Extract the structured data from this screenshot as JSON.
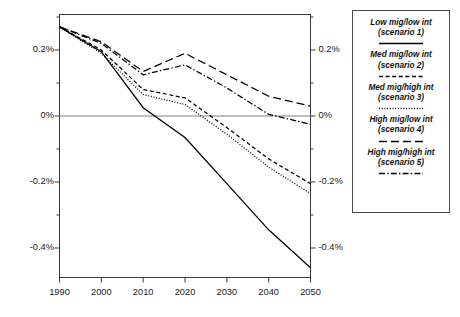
{
  "chart_data": {
    "type": "line",
    "title": "",
    "xlabel": "",
    "ylabel": "",
    "x": [
      1990,
      2000,
      2010,
      2020,
      2030,
      2040,
      2050
    ],
    "xlim": [
      1990,
      2050
    ],
    "ylim": [
      -0.5,
      0.3
    ],
    "xticks": [
      "1990",
      "2000",
      "2010",
      "2020",
      "2030",
      "2040",
      "2050"
    ],
    "yticks": [
      "0.2%",
      "0%",
      "-0.2%",
      "-0.4%"
    ],
    "ytick_values": [
      0.2,
      0.0,
      -0.2,
      -0.4
    ],
    "minor_ticks": true,
    "grid": false,
    "zero_line": true,
    "legend_position": "right",
    "dual_y_axis": true,
    "series": [
      {
        "name": "Low mig/low int (scenario 1)",
        "scenario": "1",
        "style": "solid",
        "values": [
          0.27,
          0.195,
          0.025,
          -0.065,
          -0.205,
          -0.345,
          -0.46
        ]
      },
      {
        "name": "Med mig/low int (scenario 2)",
        "scenario": "2",
        "style": "dashed",
        "values": [
          0.27,
          0.2,
          0.08,
          0.055,
          -0.035,
          -0.13,
          -0.205
        ]
      },
      {
        "name": "Med mig/high int (scenario 3)",
        "scenario": "3",
        "style": "dotted",
        "values": [
          0.27,
          0.19,
          0.065,
          0.035,
          -0.055,
          -0.155,
          -0.235
        ]
      },
      {
        "name": "High mig/low int (scenario 4)",
        "scenario": "4",
        "style": "long-dash",
        "values": [
          0.27,
          0.225,
          0.135,
          0.19,
          0.125,
          0.06,
          0.03
        ]
      },
      {
        "name": "High mig/high int (scenario 5)",
        "scenario": "5",
        "style": "dash-dot",
        "values": [
          0.27,
          0.22,
          0.125,
          0.155,
          0.085,
          0.005,
          -0.025
        ]
      }
    ]
  },
  "legend": {
    "entries": [
      {
        "line1": "Low mig/low int",
        "line2": "(scenario 1)"
      },
      {
        "line1": "Med mig/low int",
        "line2": "(scenario 2)"
      },
      {
        "line1": "Med mig/high int",
        "line2": "(scenario 3)"
      },
      {
        "line1": "High mig/low int",
        "line2": "(scenario 4)"
      },
      {
        "line1": "High mig/high int",
        "line2": "(scenario 5)"
      }
    ]
  },
  "axes": {
    "y_left": [
      "0.2%",
      "0%",
      "-0.2%",
      "-0.4%"
    ],
    "y_right": [
      "0.2%",
      "0%",
      "-0.2%",
      "-0.4%"
    ],
    "x": [
      "1990",
      "2000",
      "2010",
      "2020",
      "2030",
      "2040",
      "2050"
    ]
  },
  "colors": {
    "line": "#000000",
    "frame": "#3a3a3a",
    "zero_line": "#808080",
    "text": "#1a1a1a"
  }
}
